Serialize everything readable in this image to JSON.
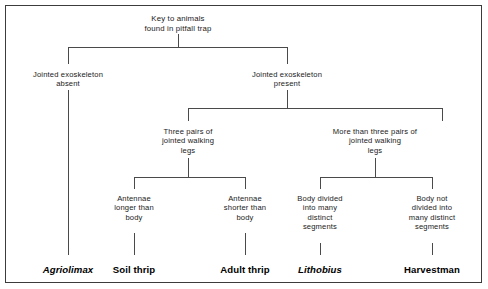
{
  "diagram": {
    "type": "dichotomous-key",
    "title": "Key to animals\nfound in pitfall trap",
    "border_color": "#3c3c3c",
    "line_color": "#4a4a4a",
    "background": "#ffffff",
    "nodes": [
      {
        "id": "root",
        "label": "Key to animals\nfound in pitfall trap",
        "x": 178,
        "y": 14,
        "level": 0
      },
      {
        "id": "exoskeleton-absent",
        "label": "Jointed exoskeleton\nabsent",
        "x": 68,
        "y": 70,
        "level": 1
      },
      {
        "id": "exoskeleton-present",
        "label": "Jointed exoskeleton\npresent",
        "x": 287,
        "y": 70,
        "level": 1
      },
      {
        "id": "three-pairs-legs",
        "label": "Three pairs of\njointed walking\nlegs",
        "x": 188,
        "y": 127,
        "level": 2
      },
      {
        "id": "more-than-three-pairs-legs",
        "label": "More than three pairs of\njointed walking\nlegs",
        "x": 375,
        "y": 127,
        "level": 2
      },
      {
        "id": "antennae-longer",
        "label": "Antennae\nlonger than\nbody",
        "x": 134,
        "y": 194,
        "level": 3
      },
      {
        "id": "antennae-shorter",
        "label": "Antennae\nshorter than\nbody",
        "x": 245,
        "y": 194,
        "level": 3
      },
      {
        "id": "body-divided",
        "label": "Body divided\ninto many\ndistinct\nsegments",
        "x": 320,
        "y": 194,
        "level": 3
      },
      {
        "id": "body-not-divided",
        "label": "Body not\ndivided into\nmany distinct\nsegments",
        "x": 432,
        "y": 194,
        "level": 3
      }
    ],
    "leaves": [
      {
        "id": "agriolimax",
        "label": "Agriolimax",
        "x": 68,
        "y": 264,
        "italic": true
      },
      {
        "id": "soil-thrip",
        "label": "Soil thrip",
        "x": 134,
        "y": 264,
        "italic": false
      },
      {
        "id": "adult-thrip",
        "label": "Adult thrip",
        "x": 245,
        "y": 264,
        "italic": false
      },
      {
        "id": "lithobius",
        "label": "Lithobius",
        "x": 320,
        "y": 264,
        "italic": true
      },
      {
        "id": "harvestman",
        "label": "Harvestman",
        "x": 432,
        "y": 264,
        "italic": false
      }
    ],
    "connectors": [
      {
        "id": "root-stem",
        "type": "vline",
        "x": 178,
        "y1": 34,
        "y2": 47
      },
      {
        "id": "level1-bracket",
        "type": "hline",
        "x1": 68,
        "x2": 287,
        "y": 47
      },
      {
        "id": "level1-left-drop",
        "type": "vline",
        "x": 68,
        "y1": 47,
        "y2": 64
      },
      {
        "id": "level1-right-drop",
        "type": "vline",
        "x": 287,
        "y1": 47,
        "y2": 64
      },
      {
        "id": "agriolimax-long-drop",
        "type": "vline",
        "x": 68,
        "y1": 90,
        "y2": 255
      },
      {
        "id": "present-stem",
        "type": "vline",
        "x": 287,
        "y1": 90,
        "y2": 108
      },
      {
        "id": "level2-bracket",
        "type": "hline",
        "x1": 188,
        "x2": 442,
        "y": 108
      },
      {
        "id": "level2-left-drop",
        "type": "vline",
        "x": 188,
        "y1": 108,
        "y2": 121
      },
      {
        "id": "level2-right-drop",
        "type": "vline",
        "x": 442,
        "y1": 108,
        "y2": 121
      },
      {
        "id": "three-pairs-stem",
        "type": "vline",
        "x": 188,
        "y1": 158,
        "y2": 177
      },
      {
        "id": "level3-left-bracket",
        "type": "hline",
        "x1": 134,
        "x2": 245,
        "y": 177
      },
      {
        "id": "level3-left-drop-a",
        "type": "vline",
        "x": 134,
        "y1": 177,
        "y2": 189
      },
      {
        "id": "level3-left-drop-b",
        "type": "vline",
        "x": 245,
        "y1": 177,
        "y2": 189
      },
      {
        "id": "more-pairs-stem",
        "type": "vline",
        "x": 375,
        "y1": 158,
        "y2": 177
      },
      {
        "id": "level3-right-bracket",
        "type": "hline",
        "x1": 320,
        "x2": 432,
        "y": 177
      },
      {
        "id": "level3-right-drop-a",
        "type": "vline",
        "x": 320,
        "y1": 177,
        "y2": 189
      },
      {
        "id": "level3-right-drop-b",
        "type": "vline",
        "x": 432,
        "y1": 177,
        "y2": 189
      },
      {
        "id": "soil-thrip-drop",
        "type": "vline",
        "x": 134,
        "y1": 233,
        "y2": 255
      },
      {
        "id": "adult-thrip-drop",
        "type": "vline",
        "x": 245,
        "y1": 233,
        "y2": 255
      },
      {
        "id": "lithobius-drop",
        "type": "vline",
        "x": 320,
        "y1": 243,
        "y2": 255
      },
      {
        "id": "harvestman-drop",
        "type": "vline",
        "x": 432,
        "y1": 243,
        "y2": 255
      }
    ]
  }
}
